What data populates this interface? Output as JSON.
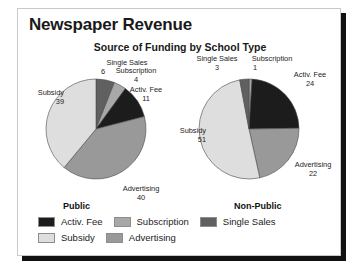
{
  "card": {
    "title": "Newspaper Revenue",
    "subtitle": "Source of Funding by School Type"
  },
  "chart_data": {
    "type": "pie",
    "title": "Newspaper Revenue",
    "subtitle": "Source of Funding by School Type",
    "legend_position": "bottom",
    "categories": [
      "Activ. Fee",
      "Subscription",
      "Single Sales",
      "Subsidy",
      "Advertising"
    ],
    "colors": {
      "Activ. Fee": "#1c1c1c",
      "Subscription": "#a8a8a8",
      "Single Sales": "#606060",
      "Subsidy": "#dedede",
      "Advertising": "#999999"
    },
    "charts": [
      {
        "name": "Public",
        "slices": [
          {
            "label": "Single Sales",
            "value": 6
          },
          {
            "label": "Subscription",
            "value": 4
          },
          {
            "label": "Activ. Fee",
            "value": 11
          },
          {
            "label": "Advertising",
            "value": 40
          },
          {
            "label": "Subsidy",
            "value": 39
          }
        ]
      },
      {
        "name": "Non-Public",
        "slices": [
          {
            "label": "Subscription",
            "value": 1
          },
          {
            "label": "Activ. Fee",
            "value": 24
          },
          {
            "label": "Advertising",
            "value": 22
          },
          {
            "label": "Subsidy",
            "value": 51
          },
          {
            "label": "Single Sales",
            "value": 3
          }
        ]
      }
    ]
  },
  "pie_left": {
    "category": "Public",
    "labels": {
      "single_sales": "Single Sales",
      "single_sales_value": "6",
      "subscription": "Subscription",
      "subscription_value": "4",
      "activ_fee": "Activ. Fee",
      "activ_fee_value": "11",
      "subsidy": "Subsidy",
      "subsidy_value": "39",
      "advertising": "Advertising",
      "advertising_value": "40"
    }
  },
  "pie_right": {
    "category": "Non-Public",
    "labels": {
      "single_sales": "Single Sales",
      "single_sales_value": "3",
      "subscription": "Subscription",
      "subscription_value": "1",
      "activ_fee": "Activ. Fee",
      "activ_fee_value": "24",
      "subsidy": "Subsidy",
      "subsidy_value": "51",
      "advertising": "Advertising",
      "advertising_value": "22"
    }
  },
  "legend": {
    "items": [
      {
        "label": "Activ. Fee",
        "color": "#1c1c1c"
      },
      {
        "label": "Subscription",
        "color": "#a8a8a8"
      },
      {
        "label": "Single Sales",
        "color": "#606060"
      },
      {
        "label": "Subsidy",
        "color": "#dedede"
      },
      {
        "label": "Advertising",
        "color": "#999999"
      }
    ]
  }
}
